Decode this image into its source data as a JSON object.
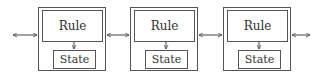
{
  "diagram": {
    "type": "chain of rule/state cells",
    "cells": [
      {
        "rule_label": "Rule",
        "state_label": "State"
      },
      {
        "rule_label": "Rule",
        "state_label": "State"
      },
      {
        "rule_label": "Rule",
        "state_label": "State"
      }
    ],
    "connections": [
      {
        "from": "left-edge",
        "to": "cell-1",
        "style": "bidirectional-arrow"
      },
      {
        "from": "cell-1",
        "to": "cell-2",
        "style": "bidirectional-arrow"
      },
      {
        "from": "cell-2",
        "to": "cell-3",
        "style": "bidirectional-arrow"
      },
      {
        "from": "cell-3",
        "to": "right-edge",
        "style": "bidirectional-arrow"
      }
    ],
    "internal_connection": {
      "from": "rule",
      "to": "state",
      "style": "down-arrow"
    },
    "colors": {
      "stroke": "#555555",
      "text": "#333333",
      "background": "#ffffff"
    }
  }
}
